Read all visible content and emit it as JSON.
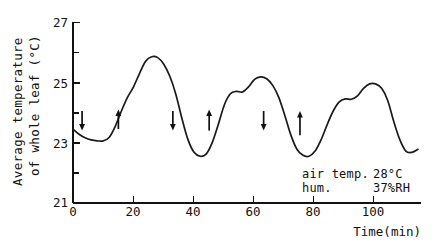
{
  "chart_data": {
    "type": "line",
    "title": "",
    "xlabel": "Time(min)",
    "ylabel_line1": "Average temperature",
    "ylabel_line2": "of whole leaf (°C)",
    "xlim": [
      0,
      115
    ],
    "ylim": [
      21,
      27
    ],
    "xticks": [
      0,
      20,
      40,
      60,
      80,
      100
    ],
    "xtick_labels": [
      "0",
      "20",
      "40",
      "60",
      "80",
      "100"
    ],
    "yticks": [
      21,
      23,
      25,
      27
    ],
    "ytick_labels": [
      "21",
      "23",
      "25",
      "27"
    ],
    "yticks_minor": [
      22,
      24,
      26
    ],
    "grid": false,
    "legend": "none",
    "series": [
      {
        "name": "Average leaf temperature",
        "x": [
          0,
          2,
          4,
          6,
          8,
          10,
          12,
          14,
          16,
          18,
          20,
          22,
          24,
          26,
          28,
          30,
          32,
          34,
          36,
          38,
          40,
          42,
          44,
          46,
          48,
          50,
          52,
          54,
          56,
          58,
          60,
          62,
          64,
          66,
          68,
          70,
          72,
          74,
          76,
          78,
          80,
          82,
          84,
          86,
          88,
          90,
          92,
          94,
          96,
          98,
          100,
          102,
          104,
          106,
          108,
          110,
          112,
          114
        ],
        "y": [
          23.45,
          23.28,
          23.16,
          23.09,
          23.06,
          23.06,
          23.18,
          23.55,
          24.05,
          24.5,
          24.85,
          25.3,
          25.7,
          25.85,
          25.82,
          25.6,
          25.2,
          24.6,
          23.8,
          23.1,
          22.68,
          22.55,
          22.62,
          23.0,
          23.6,
          24.25,
          24.62,
          24.7,
          24.68,
          24.85,
          25.1,
          25.18,
          25.12,
          24.9,
          24.5,
          23.9,
          23.25,
          22.78,
          22.58,
          22.55,
          22.72,
          23.1,
          23.6,
          24.05,
          24.35,
          24.45,
          24.44,
          24.55,
          24.8,
          24.95,
          24.95,
          24.8,
          24.4,
          23.7,
          23.1,
          22.72,
          22.68,
          22.78
        ],
        "annotations": [
          {
            "label": "arrow-down-1",
            "x": 3,
            "direction": "down",
            "y_top": 24.05,
            "y_bottom": 23.4
          },
          {
            "label": "arrow-up-1",
            "x": 15,
            "direction": "up",
            "y_top": 24.1,
            "y_bottom": 23.45
          },
          {
            "label": "arrow-down-2",
            "x": 33,
            "direction": "down",
            "y_top": 24.05,
            "y_bottom": 23.4
          },
          {
            "label": "arrow-up-2",
            "x": 45,
            "direction": "up",
            "y_top": 24.1,
            "y_bottom": 23.4
          },
          {
            "label": "arrow-down-3",
            "x": 63,
            "direction": "down",
            "y_top": 24.05,
            "y_bottom": 23.4
          },
          {
            "label": "arrow-up-3",
            "x": 75,
            "direction": "up",
            "y_top": 24.05,
            "y_bottom": 23.25
          }
        ]
      }
    ],
    "text_annotations": {
      "air_temp_label": "air temp.",
      "air_temp_value": "28°C",
      "humidity_label": "hum.",
      "humidity_value": "37%RH"
    },
    "colors": {
      "curve": "#1a1a1a",
      "axis": "#111111",
      "background": "#ffffff"
    }
  }
}
